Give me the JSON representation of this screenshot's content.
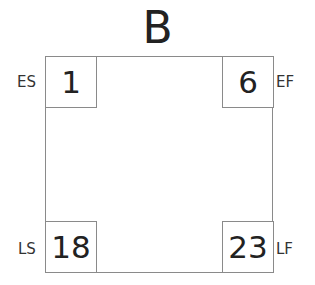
{
  "activity": {
    "name": "B",
    "early_start": {
      "label": "ES",
      "value": "1"
    },
    "early_finish": {
      "label": "EF",
      "value": "6"
    },
    "late_start": {
      "label": "LS",
      "value": "18"
    },
    "late_finish": {
      "label": "LF",
      "value": "23"
    }
  }
}
